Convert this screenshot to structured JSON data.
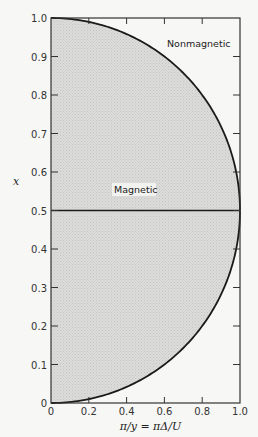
{
  "chart_data": {
    "type": "area",
    "title": "",
    "xlabel": "π/y = πΔ/U",
    "ylabel": "x",
    "xlim": [
      0,
      1.0
    ],
    "ylim": [
      0,
      1.0
    ],
    "xticks": [
      "0",
      "0.2",
      "0.4",
      "0.6",
      "0.8",
      "1.0"
    ],
    "yticks": [
      "0",
      "0.1",
      "0.2",
      "0.3",
      "0.4",
      "0.5",
      "0.6",
      "0.7",
      "0.8",
      "0.9",
      "1.0"
    ],
    "grid": false,
    "series": [
      {
        "name": "Phase boundary (upper)",
        "x": [
          0,
          0.1,
          0.2,
          0.3,
          0.4,
          0.5,
          0.6,
          0.7,
          0.8,
          0.9,
          0.95,
          1.0
        ],
        "y": [
          1.0,
          0.997,
          0.987,
          0.97,
          0.946,
          0.914,
          0.874,
          0.825,
          0.764,
          0.686,
          0.636,
          0.5
        ]
      },
      {
        "name": "Phase boundary (lower)",
        "x": [
          0,
          0.1,
          0.2,
          0.3,
          0.4,
          0.5,
          0.6,
          0.7,
          0.8,
          0.9,
          0.95,
          1.0
        ],
        "y": [
          0.0,
          0.003,
          0.013,
          0.03,
          0.054,
          0.086,
          0.126,
          0.175,
          0.236,
          0.314,
          0.364,
          0.5
        ]
      },
      {
        "name": "x = 0.5 line",
        "x": [
          0,
          1.0
        ],
        "y": [
          0.5,
          0.5
        ]
      }
    ],
    "regions": [
      {
        "label": "Magnetic",
        "fill": "shaded",
        "inside_boundary": true
      },
      {
        "label": "Nonmagnetic",
        "fill": "none",
        "inside_boundary": false
      }
    ],
    "annotations": [
      {
        "text": "Nonmagnetic",
        "x": 0.82,
        "y": 0.93
      },
      {
        "text": "Magnetic",
        "x": 0.45,
        "y": 0.55
      }
    ]
  },
  "labels": {
    "nonmagnetic": "Nonmagnetic",
    "magnetic": "Magnetic",
    "xlabel": "π/y = πΔ/U",
    "ylabel": "x"
  },
  "colors": {
    "shade": "#d8d8d6",
    "line": "#1a1a1a",
    "background": "#f7f7f5"
  }
}
